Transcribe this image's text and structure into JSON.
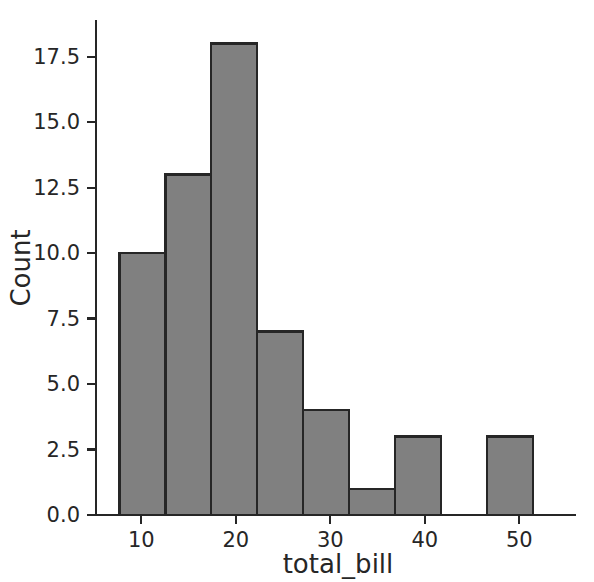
{
  "chart_data": {
    "type": "bar",
    "subtype": "histogram",
    "title": "",
    "xlabel": "total_bill",
    "ylabel": "Count",
    "xlim": [
      5.2,
      56.0
    ],
    "ylim": [
      0,
      18.9
    ],
    "grid": false,
    "legend": null,
    "bin_width": 4.86,
    "bin_edges": [
      7.68,
      12.54,
      17.4,
      22.26,
      27.12,
      31.98,
      36.84,
      41.7,
      46.56,
      51.42
    ],
    "bin_centers": [
      10.11,
      14.97,
      19.83,
      24.69,
      29.55,
      34.41,
      39.27,
      44.13,
      48.99
    ],
    "values": [
      10,
      13,
      18,
      7,
      4,
      1,
      3,
      0,
      3
    ],
    "categories": [
      "7.7-12.5",
      "12.5-17.4",
      "17.4-22.3",
      "22.3-27.1",
      "27.1-32.0",
      "32.0-36.8",
      "36.8-41.7",
      "41.7-46.6",
      "46.6-51.4"
    ],
    "xticks": [
      10,
      20,
      30,
      40,
      50
    ],
    "xtick_labels": [
      "10",
      "20",
      "30",
      "40",
      "50"
    ],
    "yticks": [
      0.0,
      2.5,
      5.0,
      7.5,
      10.0,
      12.5,
      15.0,
      17.5
    ],
    "ytick_labels": [
      "0.0",
      "2.5",
      "5.0",
      "7.5",
      "10.0",
      "12.5",
      "15.0",
      "17.5"
    ],
    "colors": {
      "bar_fill": "#808080",
      "bar_edge": "#262626",
      "axis": "#262626",
      "text": "#262626",
      "background": "#ffffff"
    }
  },
  "axes": {
    "x_title": "total_bill",
    "y_title": "Count"
  }
}
